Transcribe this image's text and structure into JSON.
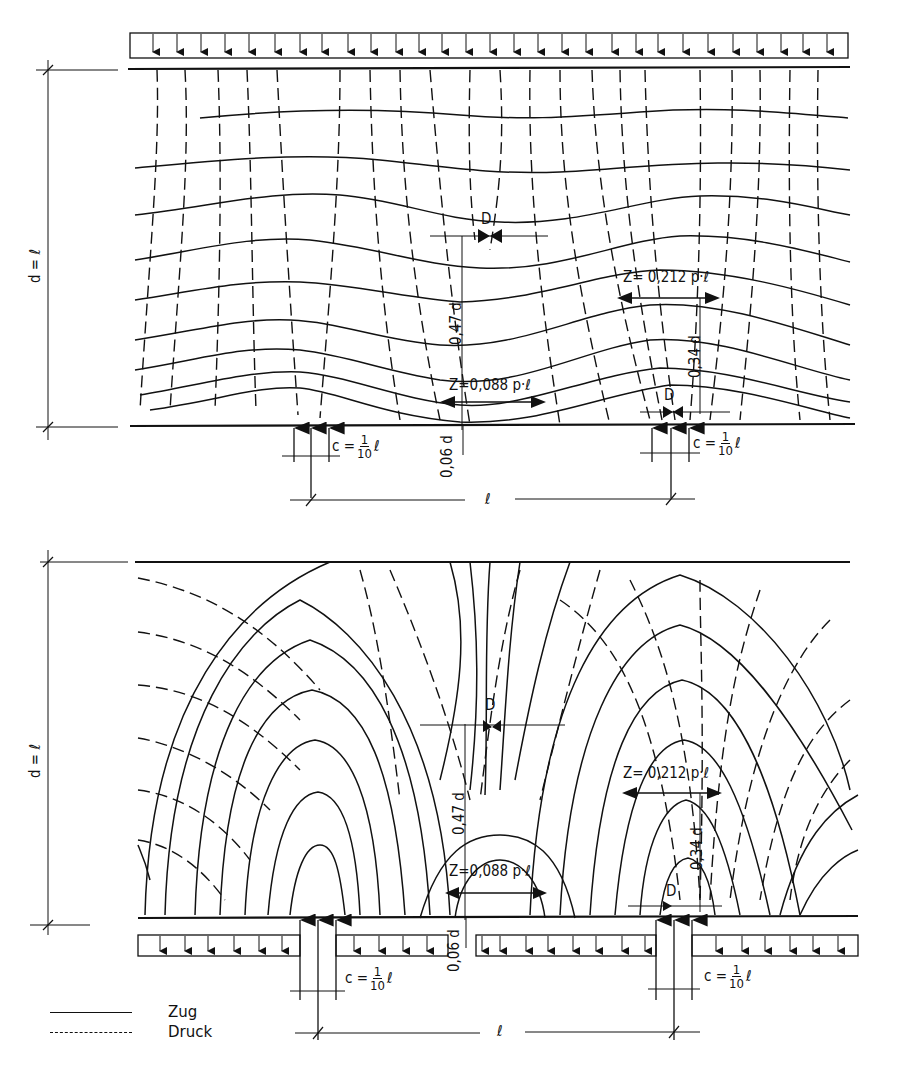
{
  "figure": {
    "type": "stress-trajectory diagram (deep beam / wall, Zug/Druck)",
    "panels": [
      {
        "id": "top",
        "load_case": "uniform load p on top edge, point supports below",
        "height_label": "d = ℓ",
        "labels": {
          "compression_top": "D",
          "compression_support": "D",
          "tension_mid": "Z=0,088 p·ℓ",
          "tension_support": "Z= 0,212 p·ℓ",
          "lever_mid": "0,47 d",
          "lever_support": "0,34 d",
          "bottom_offset": "0,06 d",
          "support_width_left": {
            "prefix": "c =",
            "num": "1",
            "den": "10",
            "suffix": "ℓ"
          },
          "support_width_right": {
            "prefix": "c =",
            "num": "1",
            "den": "10",
            "suffix": "ℓ"
          },
          "span": "ℓ"
        }
      },
      {
        "id": "bottom",
        "load_case": "uniform load p hanging on bottom edge, point supports",
        "height_label": "d = ℓ",
        "labels": {
          "compression_top": "D",
          "compression_support": "D",
          "tension_mid": "Z=0,088 p·ℓ",
          "tension_support": "Z= 0,212 p·ℓ",
          "lever_mid": "0,47 d",
          "lever_support": "0,34 d",
          "bottom_offset": "0,06 d",
          "support_width_left": {
            "prefix": "c =",
            "num": "1",
            "den": "10",
            "suffix": "ℓ"
          },
          "support_width_right": {
            "prefix": "c =",
            "num": "1",
            "den": "10",
            "suffix": "ℓ"
          },
          "span": "ℓ"
        }
      }
    ],
    "legend": [
      {
        "style": "solid",
        "label": "Zug"
      },
      {
        "style": "dashed",
        "label": "Druck"
      }
    ],
    "colors": {
      "ink": "#111111",
      "paper": "#ffffff"
    }
  }
}
